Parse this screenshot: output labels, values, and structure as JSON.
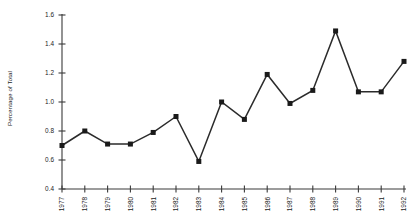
{
  "chart_data": {
    "type": "line",
    "title": "",
    "xlabel": "",
    "ylabel": "Percentage of Total",
    "categories": [
      "1977",
      "1978",
      "1979",
      "1980",
      "1981",
      "1982",
      "1983",
      "1984",
      "1985",
      "1986",
      "1987",
      "1988",
      "1989",
      "1990",
      "1991",
      "1992"
    ],
    "values": [
      0.7,
      0.8,
      0.71,
      0.71,
      0.79,
      0.9,
      0.59,
      1.0,
      0.88,
      1.19,
      0.99,
      1.08,
      1.49,
      1.07,
      1.07,
      1.28
    ],
    "ylim": [
      0.4,
      1.6
    ],
    "yticks": [
      "0.4",
      "0.6",
      "0.8",
      "1.0",
      "1.2",
      "1.4",
      "1.6"
    ],
    "ytick_values": [
      0.4,
      0.6,
      0.8,
      1.0,
      1.2,
      1.4,
      1.6
    ],
    "grid": false,
    "legend": null,
    "marker": "square",
    "marker_color": "#1a1a1a",
    "line_color": "#2b2b2b"
  },
  "axis": {
    "y_title": "Percentage of Total"
  }
}
